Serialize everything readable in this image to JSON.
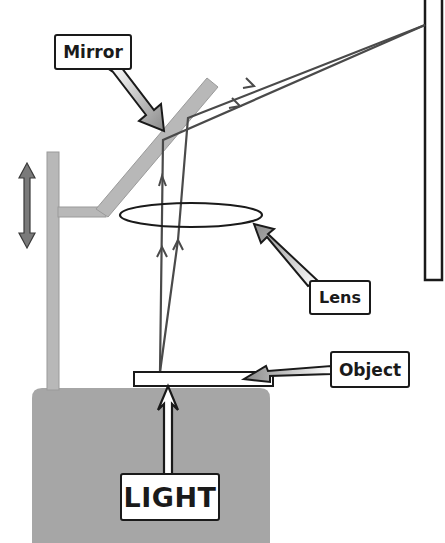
{
  "diagram": {
    "labels": {
      "mirror": "Mirror",
      "lens": "Lens",
      "object": "Object",
      "light": "LIGHT"
    },
    "components": [
      {
        "name": "light-source-box",
        "description": "Gray housing containing the light source"
      },
      {
        "name": "object-plate",
        "description": "Transparent object/slide on top of the housing"
      },
      {
        "name": "lens",
        "description": "Convex lens shown as ellipse"
      },
      {
        "name": "mirror",
        "description": "Inclined plane mirror at ~45 degrees"
      },
      {
        "name": "support-post",
        "description": "Vertical post with arm holding lens and mirror"
      },
      {
        "name": "height-adjust-arrow",
        "description": "Double-headed arrow indicating vertical adjustment"
      },
      {
        "name": "screen",
        "description": "Vertical screen on the right"
      }
    ],
    "rays": {
      "count": 2,
      "origin": "object",
      "path": [
        "object",
        "lens",
        "mirror",
        "screen"
      ]
    },
    "colors": {
      "housing": "#a6a6a6",
      "mirror": "#b8b8b8",
      "post": "#b8b8b8",
      "adjust_arrow": "#7a7a7a",
      "ray": "#4a4a4a",
      "outline": "#1a1a1a",
      "background": "#ffffff"
    }
  }
}
